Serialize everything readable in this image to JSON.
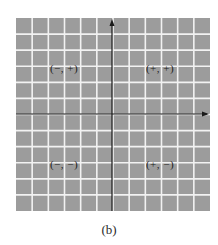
{
  "figure": {
    "caption": "(b)",
    "background_color": "#9c9c9c",
    "grid_line_color": "#f2f2f2",
    "axis_color": "#1a1a1a",
    "grid": {
      "left": 16,
      "top": 18,
      "width": 194,
      "height": 193,
      "columns": 12,
      "rows": 12
    },
    "axes": {
      "x_axis_y": 114,
      "y_axis_x": 112
    },
    "quadrants": [
      {
        "name": "quadrant-ii",
        "label": "(−, +)",
        "x": 64,
        "y": 68
      },
      {
        "name": "quadrant-i",
        "label": "(+, +)",
        "x": 160,
        "y": 68
      },
      {
        "name": "quadrant-iii",
        "label": "(−, −)",
        "x": 64,
        "y": 164
      },
      {
        "name": "quadrant-iv",
        "label": "(+, −)",
        "x": 160,
        "y": 164
      }
    ]
  }
}
